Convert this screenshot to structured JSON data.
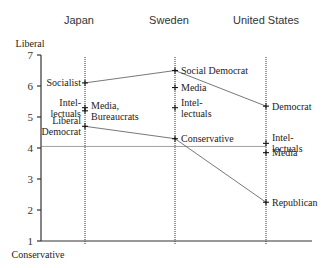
{
  "chart_data": {
    "type": "scatter",
    "title": "",
    "ylabel_top": "Liberal",
    "ylabel_bottom": "Conservative",
    "ylim": [
      1,
      7
    ],
    "yticks": [
      "1",
      "2",
      "3",
      "4",
      "5",
      "6",
      "7"
    ],
    "reference_line": 4.05,
    "categories": [
      "Japan",
      "Sweden",
      "United States"
    ],
    "points": [
      {
        "country": 0,
        "label": "Socialist",
        "value": 6.1,
        "side": "left"
      },
      {
        "country": 0,
        "label": "Intel-\nlectuals",
        "value": 5.3,
        "side": "left"
      },
      {
        "country": 0,
        "label": "Media,\nBureaucrats",
        "value": 5.2,
        "side": "right"
      },
      {
        "country": 0,
        "label": "Liberal\nDemocrat",
        "value": 4.7,
        "side": "left"
      },
      {
        "country": 1,
        "label": "Social Democrat",
        "value": 6.5,
        "side": "right"
      },
      {
        "country": 1,
        "label": "Media",
        "value": 5.95,
        "side": "right"
      },
      {
        "country": 1,
        "label": "Intel-\nlectuals",
        "value": 5.3,
        "side": "right"
      },
      {
        "country": 1,
        "label": "Conservative",
        "value": 4.3,
        "side": "right"
      },
      {
        "country": 2,
        "label": "Democrat",
        "value": 5.35,
        "side": "right"
      },
      {
        "country": 2,
        "label": "Intel-\nlectuals",
        "value": 4.15,
        "side": "right"
      },
      {
        "country": 2,
        "label": "Media",
        "value": 3.85,
        "side": "right"
      },
      {
        "country": 2,
        "label": "Republican",
        "value": 2.25,
        "side": "right"
      }
    ],
    "series": [
      {
        "name": "Left party",
        "values": [
          6.1,
          6.5,
          5.35
        ]
      },
      {
        "name": "Right party",
        "values": [
          4.7,
          4.3,
          2.25
        ]
      }
    ],
    "grid": false,
    "legend": "none"
  }
}
